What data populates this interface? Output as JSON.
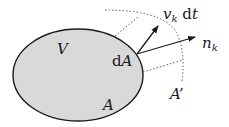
{
  "diagram": {
    "colors": {
      "region_fill": "#d9d9d9",
      "stroke": "#1a1a1a",
      "dotted": "#555555",
      "background": "#ffffff"
    },
    "region": {
      "shape": "ellipse",
      "cx": 78,
      "cy": 75,
      "rx": 65,
      "ry": 46
    },
    "labels": {
      "volume": "V",
      "surface": "A",
      "surface_element_d": "d",
      "surface_element_A": "A",
      "displaced_surface": "A’",
      "velocity_v": "v",
      "velocity_sub": "k",
      "velocity_dt_d": " d",
      "velocity_dt_t": "t",
      "normal_n": "n",
      "normal_sub": "k"
    },
    "vectors": [
      {
        "name": "velocity-displacement",
        "label": "v_k dt",
        "from": [
          137,
          54
        ],
        "to": [
          158,
          26
        ]
      },
      {
        "name": "normal",
        "label": "n_k",
        "from": [
          137,
          54
        ],
        "to": [
          195,
          37
        ]
      }
    ]
  }
}
